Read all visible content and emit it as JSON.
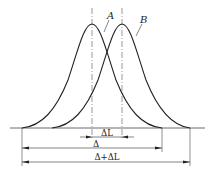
{
  "diagram": {
    "curve_a_label": "A",
    "curve_b_label": "B",
    "dim_delta_l": "ΔL",
    "dim_delta": "Δ",
    "dim_delta_plus_delta_l": "Δ+ΔL",
    "line_color": "#222222"
  }
}
